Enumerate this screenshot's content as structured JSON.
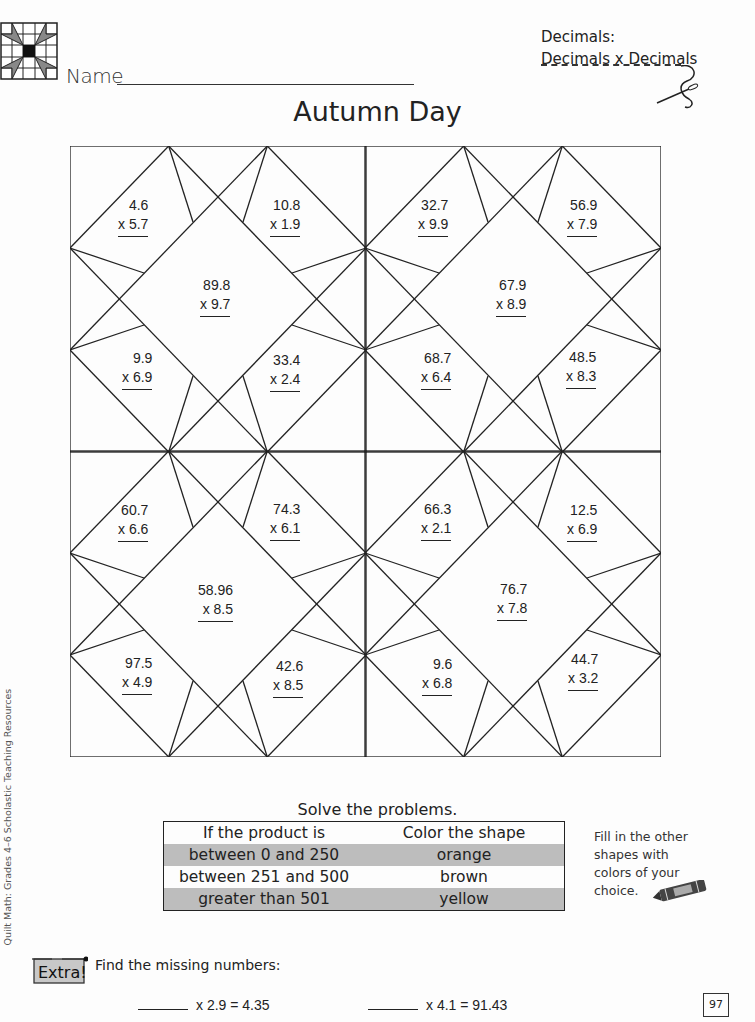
{
  "header": {
    "name_label": "Name",
    "topic_line1": "Decimals:",
    "topic_line2": "Decimals x Decimals",
    "title": "Autumn Day"
  },
  "puzzle": {
    "quadrants": [
      {
        "id": "top-left",
        "problems": [
          {
            "pos": "upper-left",
            "top": "4.6",
            "bottom": "x  5.7"
          },
          {
            "pos": "upper-right",
            "top": "10.8",
            "bottom": "x  1.9"
          },
          {
            "pos": "center",
            "top": "89.8",
            "bottom": "x  9.7"
          },
          {
            "pos": "lower-left",
            "top": "9.9",
            "bottom": "x  6.9"
          },
          {
            "pos": "lower-right",
            "top": "33.4",
            "bottom": "x  2.4"
          }
        ]
      },
      {
        "id": "top-right",
        "problems": [
          {
            "pos": "upper-left",
            "top": "32.7",
            "bottom": "x  9.9"
          },
          {
            "pos": "upper-right",
            "top": "56.9",
            "bottom": "x  7.9"
          },
          {
            "pos": "center",
            "top": "67.9",
            "bottom": "x  8.9"
          },
          {
            "pos": "lower-left",
            "top": "68.7",
            "bottom": "x  6.4"
          },
          {
            "pos": "lower-right",
            "top": "48.5",
            "bottom": "x  8.3"
          }
        ]
      },
      {
        "id": "bottom-left",
        "problems": [
          {
            "pos": "upper-left",
            "top": "60.7",
            "bottom": "x  6.6"
          },
          {
            "pos": "upper-right",
            "top": "74.3",
            "bottom": "x  6.1"
          },
          {
            "pos": "center",
            "top": "58.96",
            "bottom": "x  8.5"
          },
          {
            "pos": "lower-left",
            "top": "97.5",
            "bottom": "x  4.9"
          },
          {
            "pos": "lower-right",
            "top": "42.6",
            "bottom": "x  8.5"
          }
        ]
      },
      {
        "id": "bottom-right",
        "problems": [
          {
            "pos": "upper-left",
            "top": "66.3",
            "bottom": "x  2.1"
          },
          {
            "pos": "upper-right",
            "top": "12.5",
            "bottom": "x  6.9"
          },
          {
            "pos": "center",
            "top": "76.7",
            "bottom": "x  7.8"
          },
          {
            "pos": "lower-left",
            "top": "9.6",
            "bottom": "x  6.8"
          },
          {
            "pos": "lower-right",
            "top": "44.7",
            "bottom": "x  3.2"
          }
        ]
      }
    ]
  },
  "instructions": {
    "solve_label": "Solve the problems.",
    "table": {
      "headers": [
        "If the product is",
        "Color the shape"
      ],
      "rows": [
        [
          "between 0 and 250",
          "orange"
        ],
        [
          "between 251 and  500",
          "brown"
        ],
        [
          "greater than 501",
          "yellow"
        ]
      ],
      "shade_color": "#bdbdbd"
    },
    "side_note": [
      "Fill in the other",
      "shapes with",
      "colors of your",
      "choice."
    ]
  },
  "extra": {
    "badge": "Extra!",
    "prompt": "Find the missing numbers:",
    "equations": [
      {
        "text": "x  2.9  =  4.35"
      },
      {
        "text": "x  4.1  =  91.43"
      }
    ]
  },
  "footer": {
    "page_number": "97",
    "side_credit": "Quilt Math: Grades 4–6  Scholastic Teaching Resources"
  }
}
